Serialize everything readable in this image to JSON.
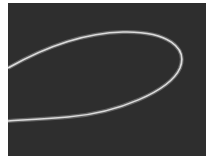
{
  "image": {
    "description": "Dark grey panel showing a glowing light-grey elliptical loop curve entering and exiting from the left edge",
    "background_color": "#ffffff",
    "panel_color": "#2e2e2e",
    "curve_color": "#d8d8d8",
    "curve_glow_color": "#9a9a9a"
  }
}
